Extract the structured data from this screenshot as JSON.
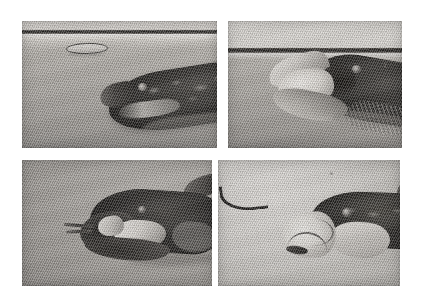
{
  "figure": {
    "title": "",
    "caption": "",
    "background_color": "#ffffff",
    "width": 424,
    "height": 301,
    "medium": "black-and-white photographic halftone",
    "layout": "2x2 grid of photographs"
  },
  "panels": [
    {
      "id": "top-left",
      "position": "row 1, column 1",
      "label": "",
      "description": "Largemouth bass approaching a small elongated prey item just below the water surface; mouth still closed.",
      "scene": {
        "water_surface_line": "dark horizontal band near top of frame",
        "prey_item": "small pale elongated minnow or lure, outlined in dark",
        "fish": "dark mottled bass body entering from lower right, snout pointing left",
        "background_tone": "#aaa6a1"
      }
    },
    {
      "id": "top-right",
      "position": "row 1, column 2",
      "label": "",
      "description": "Bass with jaws fully gaped at the water surface, engulfing the prey; suction feeding strike.",
      "scene": {
        "water_surface_line": "dark horizontal band across upper third of frame",
        "prey_item": "prey obscured inside the open mouth",
        "fish": "bass tilted head-up, mouth wide open, pale jaw membranes visible",
        "background_tone": "#a6a29d"
      }
    },
    {
      "id": "bottom-left",
      "position": "row 2, column 1",
      "label": "",
      "description": "Close view of the bass with its mouth open and a slender prey object protruding from the jaws.",
      "scene": {
        "water_surface_line": "",
        "prey_item": "thin pale strands extending forward from the mouth",
        "fish": "dark-backed bass in profile facing left, lower jaw dropped",
        "background_tone": "#aaa6a1"
      }
    },
    {
      "id": "bottom-right",
      "position": "row 2, column 2",
      "label": "",
      "description": "Bass with jaws closed and snout protruded after the strike; a dark curved worm or line is visible at upper left.",
      "scene": {
        "water_surface_line": "",
        "prey_item": "dark curved worm or line in upper left of frame",
        "fish": "bass facing left, pale snout and cheek, dark mottled back",
        "background_tone": "#d6d3cf"
      }
    }
  ],
  "palette": {
    "page_background": "#ffffff",
    "water_light": "#dedad5",
    "water_mid": "#aaa6a1",
    "water_dark": "#8e8a86",
    "surface_line": "#2b2926",
    "fish_dark": "#1a1816",
    "fish_highlight": "#efece7"
  }
}
